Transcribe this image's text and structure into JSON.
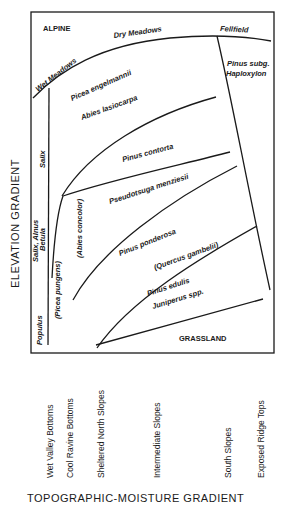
{
  "diagram": {
    "y_axis_title": "ELEVATION GRADIENT",
    "x_axis_title": "TOPOGRAPHIC-MOISTURE GRADIENT",
    "x_categories": [
      "Wet Valley Bottoms",
      "Cool Ravine Bottoms",
      "Sheltered North Slopes",
      "Intermediate Slopes",
      "South Slopes",
      "Exposed Ridge Tops"
    ],
    "zones": {
      "alpine": "ALPINE",
      "wet_meadows": "Wet Meadows",
      "dry_meadows": "Dry Meadows",
      "fellfield": "Fellfield",
      "pinus_subg_1": "Pinus subg.",
      "pinus_subg_2": "Haploxylon",
      "picea_engelmannii": "Picea engelmannii",
      "abies_lasiocarpa": "Abies lasiocarpa",
      "pinus_contorta": "Pinus contorta",
      "pseudotsuga": "Pseudotsuga menziesii",
      "abies_concolor": "(Abies concolor)",
      "pinus_ponderosa": "Pinus ponderosa",
      "quercus": "(Quercus gambelii)",
      "pinus_edulis": "Pinus edulis",
      "juniperus": "Juniperus spp.",
      "grassland": "GRASSLAND",
      "salix": "Salix",
      "salix_alnus": "Salix, Alnus",
      "betula": "Betula",
      "picea_pungens": "(Picea pungens)",
      "populus": "Populus"
    }
  }
}
